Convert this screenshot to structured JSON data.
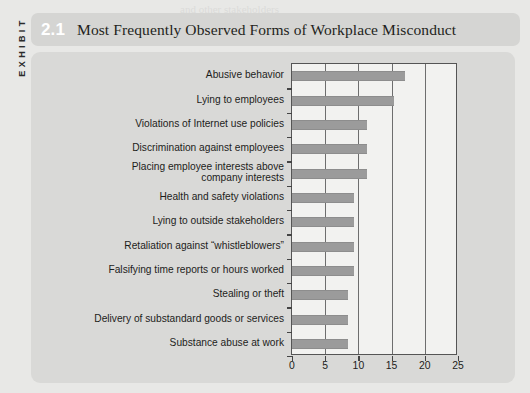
{
  "exhibit": {
    "side_label": "EXHIBIT",
    "number": "2.1",
    "title": "Most Frequently Observed Forms of Workplace Misconduct"
  },
  "chart_data": {
    "type": "bar",
    "orientation": "horizontal",
    "title": "Most Frequently Observed Forms of Workplace Misconduct",
    "xlabel": "",
    "ylabel": "",
    "xlim": [
      0,
      25
    ],
    "xticks": [
      0,
      5,
      10,
      15,
      20,
      25
    ],
    "xtick_labels": [
      "0",
      "5",
      "10",
      "15",
      "20",
      "25"
    ],
    "grid": true,
    "grid_axis": "x",
    "legend": false,
    "bar_color": "#9b9b9b",
    "plot_background": "#f2f2f0",
    "panel_background": "#d9d9d7",
    "categories": [
      "Abusive behavior",
      "Lying to employees",
      "Violations of Internet use policies",
      "Discrimination against employees",
      "Placing employee interests above\ncompany interests",
      "Health and safety violations",
      "Lying to outside stakeholders",
      "Retaliation against “whistleblowers”",
      "Falsifying time reports or hours worked",
      "Stealing or theft",
      "Delivery of substandard goods or services",
      "Substance abuse at work"
    ],
    "values": [
      17,
      15.3,
      11.3,
      11.3,
      11.3,
      9.4,
      9.4,
      9.4,
      9.4,
      8.4,
      8.4,
      8.4
    ]
  },
  "background_text": [
    "and other stakeholders",
    "are some the",
    "of ethical behavior in the workplace",
    "A recent survey",
    "reported that of employees",
    "observed misconduct at work",
    "and the most",
    "frequently observed forms",
    "are summarized in the exhibit",
    "the numbers show that",
    "many workers encounter",
    "questionable conduct",
    "on a regular basis in",
    "their organizations today",
    "companies must therefore",
    "build a culture that",
    "encourages employees to",
    "speak up when they see",
    "something wrong and to",
    "report it through proper",
    "channels without fear of",
    "retaliation from managers"
  ]
}
